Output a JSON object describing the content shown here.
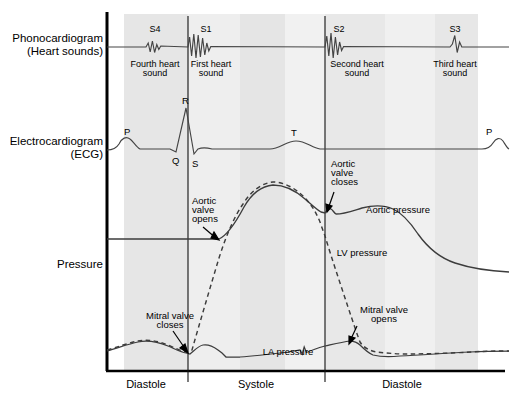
{
  "figure": {
    "type": "wiggers-diagram",
    "row_labels": {
      "phonocardiogram_line1": "Phonocardiogram",
      "phonocardiogram_line2": "(Heart sounds)",
      "ecg_line1": "Electrocardiogram",
      "ecg_line2": "(ECG)",
      "pressure": "Pressure"
    },
    "phase_axis": {
      "phases": [
        {
          "label": "Diastole",
          "x": 146
        },
        {
          "label": "Systole",
          "x": 256
        },
        {
          "label": "Diastole",
          "x": 402
        }
      ]
    },
    "heart_sounds": [
      {
        "id": "S4",
        "label": "S4",
        "name_line1": "Fourth heart",
        "name_line2": "sound",
        "x": 155
      },
      {
        "id": "S1",
        "label": "S1",
        "name_line1": "First heart",
        "name_line2": "sound",
        "x": 205
      },
      {
        "id": "S2",
        "label": "S2",
        "name_line1": "Second heart",
        "name_line2": "sound",
        "x": 339
      },
      {
        "id": "S3",
        "label": "S3",
        "name_line1": "Third heart",
        "name_line2": "sound",
        "x": 455
      }
    ],
    "ecg_waves": [
      {
        "label": "P",
        "x": 127,
        "y": 131
      },
      {
        "label": "Q",
        "x": 176,
        "y": 160
      },
      {
        "label": "R",
        "x": 186,
        "y": 105
      },
      {
        "label": "S",
        "x": 195,
        "y": 162
      },
      {
        "label": "T",
        "x": 294,
        "y": 134
      },
      {
        "label": "P",
        "x": 489,
        "y": 131
      }
    ],
    "curve_labels": [
      {
        "id": "aortic-pressure",
        "text": "Aortic pressure",
        "x": 401,
        "y": 212
      },
      {
        "id": "lv-pressure",
        "text": "LV pressure",
        "x": 338,
        "y": 253
      },
      {
        "id": "la-pressure",
        "text": "LA pressure",
        "x": 262,
        "y": 352
      }
    ],
    "annotations": [
      {
        "id": "aortic-valve-opens",
        "line1": "Aortic",
        "line2": "valve",
        "line3": "opens",
        "x": 190,
        "y": 200
      },
      {
        "id": "aortic-valve-closes",
        "line1": "Aortic",
        "line2": "valve",
        "line3": "closes",
        "x": 330,
        "y": 167
      },
      {
        "id": "mitral-valve-closes",
        "line1": "Mitral valve",
        "line2": "closes",
        "x": 143,
        "y": 316
      },
      {
        "id": "mitral-valve-opens",
        "line1": "Mitral valve",
        "line2": "opens",
        "x": 358,
        "y": 310
      }
    ],
    "colors": {
      "ink": "#000000",
      "curve": "#3a3a3a",
      "band_light": "#ebebeb",
      "band_mid": "#e3e3e3",
      "band_pale": "#f2f2f2",
      "background": "#ffffff"
    },
    "event_lines_x": [
      188,
      325
    ]
  }
}
